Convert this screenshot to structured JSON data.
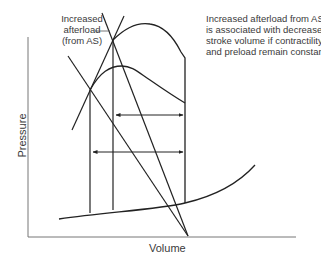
{
  "figure": {
    "type": "pressure-volume loop diagram",
    "callout_label": [
      "Increased",
      "afterload",
      "(from AS)"
    ],
    "annotation": [
      "Increased afterload from AS",
      "is associated with decreased",
      "stroke volume if contractility",
      "and preload remain constant."
    ],
    "x_axis_label": "Volume",
    "y_axis_label": "Pressure",
    "colors": {
      "line": "#222222",
      "axis": "#777777",
      "text": "#3a3a3a"
    }
  }
}
